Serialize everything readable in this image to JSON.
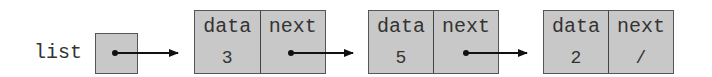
{
  "diagram": {
    "type": "singly-linked-list",
    "head": {
      "label": "list"
    },
    "nodes": [
      {
        "field_data": "data",
        "field_next": "next",
        "data": "3",
        "next": "•"
      },
      {
        "field_data": "data",
        "field_next": "next",
        "data": "5",
        "next": "•"
      },
      {
        "field_data": "data",
        "field_next": "next",
        "data": "2",
        "next": "/"
      }
    ],
    "colors": {
      "box_fill": "#c8c8c8",
      "border": "#555555",
      "arrow": "#111111"
    }
  }
}
